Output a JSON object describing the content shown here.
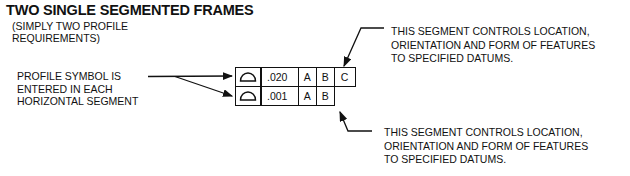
{
  "title": "TWO SINGLE SEGMENTED FRAMES",
  "subtitle": [
    "(SIMPLY TWO PROFILE",
    "REQUIREMENTS)"
  ],
  "left_label": [
    "PROFILE SYMBOL IS",
    "ENTERED IN EACH",
    "HORIZONTAL SEGMENT"
  ],
  "frame": {
    "rows": [
      {
        "symbol": "profile-of-surface-icon",
        "tolerance": ".020",
        "datums": [
          "A",
          "B",
          "C"
        ]
      },
      {
        "symbol": "profile-of-surface-icon",
        "tolerance": ".001",
        "datums": [
          "A",
          "B"
        ]
      }
    ]
  },
  "note_top": [
    "THIS SEGMENT CONTROLS LOCATION,",
    "ORIENTATION AND FORM OF FEATURES",
    "TO SPECIFIED DATUMS."
  ],
  "note_bottom": [
    "THIS SEGMENT CONTROLS LOCATION,",
    "ORIENTATION AND FORM  OF FEATURES",
    "TO SPECIFIED DATUMS."
  ],
  "colors": {
    "ink": "#111111",
    "background": "#ffffff"
  }
}
